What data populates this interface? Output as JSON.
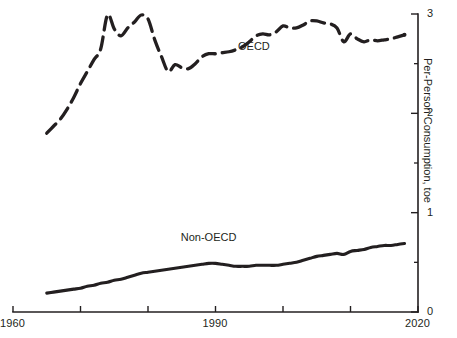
{
  "chart_data": {
    "type": "line",
    "title": "",
    "subtitle": "",
    "xlabel": "",
    "ylabel": "Per-Person Consumption, toe",
    "xlim": [
      1960,
      2020
    ],
    "ylim": [
      0,
      3.05
    ],
    "grid": false,
    "legend_position": "inline-annotations",
    "x_ticks": [
      {
        "value": 1960,
        "label": "1960",
        "show_label": true
      },
      {
        "value": 1970,
        "label": "",
        "show_label": false
      },
      {
        "value": 1980,
        "label": "",
        "show_label": false
      },
      {
        "value": 1990,
        "label": "1990",
        "show_label": true
      },
      {
        "value": 2000,
        "label": "",
        "show_label": false
      },
      {
        "value": 2010,
        "label": "",
        "show_label": false
      },
      {
        "value": 2020,
        "label": "2020",
        "show_label": true
      }
    ],
    "y_ticks": [
      {
        "value": 0,
        "label": "0",
        "major": true
      },
      {
        "value": 0.5,
        "label": "",
        "major": false
      },
      {
        "value": 1,
        "label": "1",
        "major": true
      },
      {
        "value": 1.5,
        "label": "",
        "major": false
      },
      {
        "value": 2,
        "label": "2",
        "major": true
      },
      {
        "value": 2.5,
        "label": "",
        "major": false
      },
      {
        "value": 3,
        "label": "3",
        "major": true
      }
    ],
    "series": [
      {
        "name": "OECD",
        "style": "dashed",
        "color": "#231f20",
        "annotation": {
          "text": "OECD",
          "x": 1996,
          "y": 2.68
        },
        "x": [
          1965,
          1966,
          1967,
          1968,
          1969,
          1970,
          1971,
          1972,
          1973,
          1974,
          1975,
          1976,
          1977,
          1978,
          1979,
          1980,
          1981,
          1982,
          1983,
          1984,
          1985,
          1986,
          1987,
          1988,
          1989,
          1990,
          1991,
          1992,
          1993,
          1994,
          1995,
          1996,
          1997,
          1998,
          1999,
          2000,
          2001,
          2002,
          2003,
          2004,
          2005,
          2006,
          2007,
          2008,
          2009,
          2010,
          2011,
          2012,
          2013,
          2014,
          2015,
          2016,
          2017,
          2018
        ],
        "values": [
          1.8,
          1.87,
          1.94,
          2.04,
          2.16,
          2.3,
          2.42,
          2.54,
          2.65,
          2.99,
          2.85,
          2.78,
          2.86,
          2.92,
          2.99,
          2.95,
          2.74,
          2.57,
          2.42,
          2.49,
          2.46,
          2.45,
          2.5,
          2.57,
          2.6,
          2.6,
          2.61,
          2.62,
          2.64,
          2.67,
          2.72,
          2.78,
          2.8,
          2.79,
          2.82,
          2.88,
          2.86,
          2.86,
          2.89,
          2.93,
          2.93,
          2.91,
          2.9,
          2.86,
          2.72,
          2.8,
          2.75,
          2.72,
          2.74,
          2.73,
          2.74,
          2.75,
          2.77,
          2.79
        ]
      },
      {
        "name": "Non-OECD",
        "style": "solid",
        "color": "#231f20",
        "annotation": {
          "text": "Non-OECD",
          "x": 1989,
          "y": 0.76
        },
        "x": [
          1965,
          1966,
          1967,
          1968,
          1969,
          1970,
          1971,
          1972,
          1973,
          1974,
          1975,
          1976,
          1977,
          1978,
          1979,
          1980,
          1981,
          1982,
          1983,
          1984,
          1985,
          1986,
          1987,
          1988,
          1989,
          1990,
          1991,
          1992,
          1993,
          1994,
          1995,
          1996,
          1997,
          1998,
          1999,
          2000,
          2001,
          2002,
          2003,
          2004,
          2005,
          2006,
          2007,
          2008,
          2009,
          2010,
          2011,
          2012,
          2013,
          2014,
          2015,
          2016,
          2017,
          2018
        ],
        "values": [
          0.19,
          0.2,
          0.21,
          0.22,
          0.23,
          0.24,
          0.26,
          0.27,
          0.29,
          0.3,
          0.32,
          0.33,
          0.35,
          0.37,
          0.39,
          0.4,
          0.41,
          0.42,
          0.43,
          0.44,
          0.45,
          0.46,
          0.47,
          0.48,
          0.49,
          0.49,
          0.48,
          0.47,
          0.46,
          0.46,
          0.46,
          0.47,
          0.47,
          0.47,
          0.47,
          0.48,
          0.49,
          0.5,
          0.52,
          0.54,
          0.56,
          0.57,
          0.58,
          0.59,
          0.58,
          0.61,
          0.62,
          0.63,
          0.65,
          0.66,
          0.67,
          0.67,
          0.68,
          0.69
        ]
      }
    ]
  },
  "axes": {
    "y_axis_title": "Per-Person Consumption, toe",
    "x_labels": [
      "1960",
      "1990",
      "2020"
    ],
    "y_labels": [
      "0",
      "1",
      "2",
      "3"
    ]
  },
  "annotations": {
    "oecd_label": "OECD",
    "non_oecd_label": "Non-OECD"
  },
  "colors": {
    "ink": "#231f20",
    "background": "#ffffff"
  }
}
